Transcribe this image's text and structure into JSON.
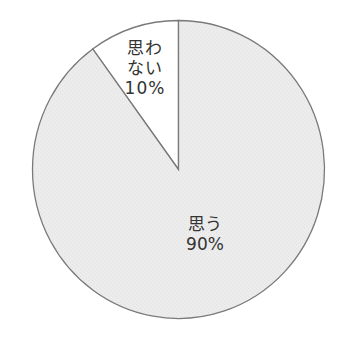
{
  "chart_data": {
    "type": "pie",
    "title": "",
    "categories": [
      "思わない",
      "思う"
    ],
    "values": [
      10,
      90
    ],
    "unit": "%",
    "slices": [
      {
        "label": "思わない",
        "display_label": "思わ\nない\n10%",
        "value": 10,
        "color": "#ffffff"
      },
      {
        "label": "思う",
        "display_label": "思う\n90%",
        "value": 90,
        "color": "#ececec"
      }
    ],
    "start_angle_deg": 0,
    "direction": "counterclockwise-from-top-for-first-slice",
    "outline_color": "#7a7a7a",
    "legend": "none"
  },
  "labels": {
    "small": "思わ\nない\n10%",
    "large": "思う\n90%"
  }
}
